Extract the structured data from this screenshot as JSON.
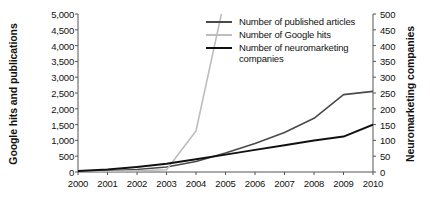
{
  "chart_data": {
    "type": "line",
    "title": "",
    "xlabel": "",
    "ylabel": "Google hits and publications",
    "y2label": "Neuromarketing companies",
    "grid": false,
    "legend_position": "top-center",
    "x": [
      2000,
      2001,
      2002,
      2003,
      2004,
      2005,
      2006,
      2007,
      2008,
      2009,
      2010
    ],
    "xtick_labels": [
      "2000",
      "2001",
      "2002",
      "2003",
      "2004",
      "2005",
      "2006",
      "2007",
      "2008",
      "2009",
      "2010"
    ],
    "ylim": [
      0,
      5000
    ],
    "ytick_labels": [
      "0",
      "500",
      "1,000",
      "1,500",
      "2,000",
      "2,500",
      "3,000",
      "3,500",
      "4,000",
      "4,500",
      "5,000"
    ],
    "ytick_values": [
      0,
      500,
      1000,
      1500,
      2000,
      2500,
      3000,
      3500,
      4000,
      4500,
      5000
    ],
    "y2lim": [
      0,
      500
    ],
    "y2tick_labels": [
      "0",
      "50",
      "100",
      "150",
      "200",
      "250",
      "300",
      "350",
      "400",
      "450",
      "500"
    ],
    "y2tick_values": [
      0,
      50,
      100,
      150,
      200,
      250,
      300,
      350,
      400,
      450,
      500
    ],
    "series": [
      {
        "name": "Number of published articles",
        "axis": "left",
        "color": "#4a4a4a",
        "values": [
          20,
          40,
          80,
          160,
          330,
          600,
          900,
          1250,
          1700,
          2450,
          2550
        ]
      },
      {
        "name": "Number of Google hits",
        "axis": "left",
        "color": "#bdbdbd",
        "clipped_above_axis": true,
        "values": [
          10,
          20,
          40,
          70,
          1300,
          5600,
          null,
          null,
          null,
          null,
          null
        ]
      },
      {
        "name": "Number of neuromarketing companies",
        "axis": "right",
        "color": "#111111",
        "values": [
          3,
          8,
          16,
          26,
          40,
          55,
          70,
          85,
          100,
          112,
          150
        ]
      }
    ]
  },
  "legend": {
    "items": [
      {
        "label": "Number of published articles",
        "color": "#4a4a4a"
      },
      {
        "label": "Number of Google hits",
        "color": "#bdbdbd"
      },
      {
        "label": "Number of neuromarketing companies",
        "color": "#111111"
      }
    ]
  },
  "axes": {
    "left_title": "Google hits and publications",
    "right_title": "Neuromarketing companies"
  }
}
